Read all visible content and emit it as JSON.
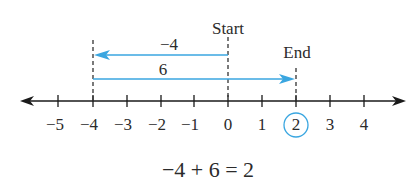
{
  "diagram": {
    "labels": {
      "start": "Start",
      "end": "End",
      "arrow_top": "−4",
      "arrow_bottom": "6"
    },
    "ticks": [
      "−5",
      "−4",
      "−3",
      "−2",
      "−1",
      "0",
      "1",
      "2",
      "3",
      "4"
    ],
    "tick_values": [
      -5,
      -4,
      -3,
      -2,
      -1,
      0,
      1,
      2,
      3,
      4
    ],
    "highlighted_value": "2",
    "equation": "−4 + 6 = 2",
    "colors": {
      "arrow": "#3aa6e0",
      "axis": "#1a1a1a",
      "text": "#2b2b2b",
      "circle": "#3aa6e0"
    }
  }
}
